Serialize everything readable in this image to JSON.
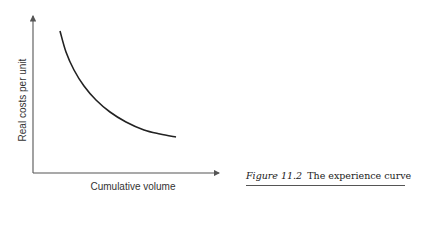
{
  "chart_data": {
    "type": "line",
    "title": "The experience curve",
    "xlabel": "Cumulative volume",
    "ylabel": "Real costs per unit",
    "grid": false,
    "legend": null,
    "ticks": "none",
    "series": [
      {
        "name": "Experience curve",
        "description": "Decreasing convex curve: real cost per unit falls as cumulative volume rises",
        "points_px": [
          [
            60,
            31
          ],
          [
            66,
            52
          ],
          [
            74,
            70
          ],
          [
            84,
            86
          ],
          [
            96,
            100
          ],
          [
            110,
            112
          ],
          [
            126,
            122
          ],
          [
            144,
            130
          ],
          [
            160,
            134
          ],
          [
            176,
            137
          ]
        ]
      }
    ],
    "axes": {
      "origin_px": [
        33,
        173
      ],
      "y_top_px": 15,
      "x_right_px": 220
    },
    "colors": {
      "curve": "#222222",
      "axes": "#555555"
    }
  },
  "figure": {
    "number": "Figure 11.2",
    "title": "The experience curve"
  }
}
